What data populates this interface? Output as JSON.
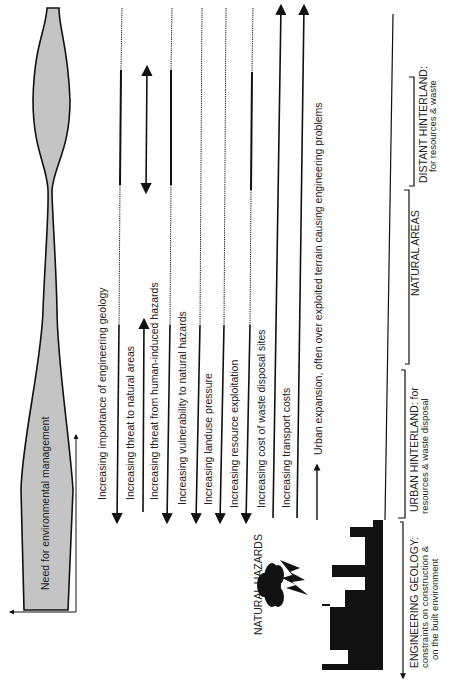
{
  "colors": {
    "ink": "#111111",
    "fill_gray": "#c4c4c4",
    "text": "#222222",
    "background": "#ffffff"
  },
  "management": {
    "label": "Need for environmental management"
  },
  "trends": [
    {
      "label": "Increasing importance of engineering geology",
      "direction": "down"
    },
    {
      "label": "Increasing threat to natural areas",
      "direction": "up"
    },
    {
      "label": "Increasing threat from human-induced hazards",
      "direction": "both"
    },
    {
      "label": "Increasing vulnerability to natural hazards",
      "direction": "down"
    },
    {
      "label": "Increasing landuse pressure",
      "direction": "down"
    },
    {
      "label": "Increasing resource exploitation",
      "direction": "down"
    },
    {
      "label": "Increasing cost of waste disposal sites",
      "direction": "down"
    },
    {
      "label": "Increasing transport costs",
      "direction": "up"
    },
    {
      "label": "Urban expansion, often over exploited terrain causing engineering problems",
      "direction": "up"
    }
  ],
  "hazards": {
    "label": "NATURAL HAZARDS",
    "icon": "storm-cloud-lightning-icon"
  },
  "city": {
    "icon": "city-skyline-icon"
  },
  "zones": [
    {
      "title": "ENGINEERING GEOLOGY:",
      "line2": "constraints on construction &",
      "line3": "on the built environment"
    },
    {
      "title": "URBAN HINTERLAND: for",
      "line2": "resources & waste disposal"
    },
    {
      "title": "NATURAL AREAS"
    },
    {
      "title": "DISTANT HINTERLAND:",
      "line2": "for resources & waste"
    }
  ]
}
